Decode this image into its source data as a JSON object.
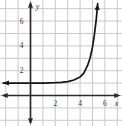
{
  "figure": {
    "background_color": "#ffffff",
    "grid_color": "#c9c9c9",
    "axis_color": "#2b2b2b",
    "curve_color": "#151515",
    "label_color": "#333333"
  },
  "chart_data": {
    "type": "line",
    "title": "",
    "xlabel": "x",
    "ylabel": "y",
    "x_ticks": [
      2,
      4,
      6
    ],
    "y_ticks": [
      2,
      4,
      6
    ],
    "xlim": [
      -2.46,
      7.38
    ],
    "ylim": [
      -2.46,
      7.7
    ],
    "grid": true,
    "grid_step": 1,
    "series": [
      {
        "name": "exponential-curve",
        "description": "exponential growth curve, horizontal asymptote y = 1",
        "asymptote_y": 1,
        "points": [
          [
            -2.2,
            1
          ],
          [
            -1,
            1
          ],
          [
            0,
            1
          ],
          [
            1,
            1
          ],
          [
            2,
            1.03
          ],
          [
            2.5,
            1.06
          ],
          [
            3,
            1.12
          ],
          [
            3.5,
            1.25
          ],
          [
            4,
            1.5
          ],
          [
            4.3,
            1.8
          ],
          [
            4.6,
            2.4
          ],
          [
            4.8,
            3.0
          ],
          [
            5.0,
            3.9
          ],
          [
            5.15,
            4.9
          ],
          [
            5.3,
            6.1
          ],
          [
            5.42,
            7.4
          ]
        ]
      }
    ]
  }
}
